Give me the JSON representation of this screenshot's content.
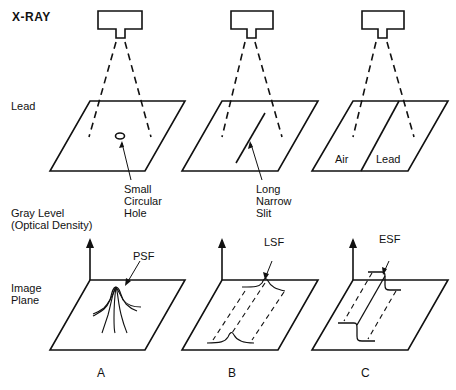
{
  "title": "X-RAY",
  "row_labels": {
    "lead": "Lead",
    "gray_level": "Gray Level\n(Optical Density)",
    "image_plane": "Image\nPlane"
  },
  "panels": [
    {
      "id": "A",
      "caption": "A",
      "aperture_label": "Small\nCircular\nHole",
      "function_label": "PSF"
    },
    {
      "id": "B",
      "caption": "B",
      "aperture_label": "Long\nNarrow\nSlit",
      "function_label": "LSF"
    },
    {
      "id": "C",
      "caption": "C",
      "aperture_label_air": "Air",
      "aperture_label_lead": "Lead",
      "function_label": "ESF"
    }
  ],
  "colors": {
    "ink": "#111111",
    "background": "#ffffff"
  }
}
